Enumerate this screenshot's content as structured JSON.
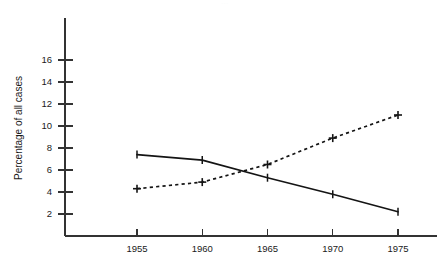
{
  "figure": {
    "background_color": "#ffffff",
    "ink_color": "#141414",
    "cropped_title_remnant": "..."
  },
  "chart_data": {
    "type": "line",
    "title": "",
    "xlabel": "",
    "ylabel": "Percentage of all cases",
    "x": [
      1955,
      1960,
      1965,
      1970,
      1975
    ],
    "xtick_labels": [
      "1955",
      "1960",
      "1965",
      "1970",
      "1975"
    ],
    "ytick_labels": [
      "2",
      "4",
      "6",
      "8",
      "10",
      "12",
      "14",
      "16"
    ],
    "yticks": [
      2,
      4,
      6,
      8,
      10,
      12,
      14,
      16
    ],
    "xlim": [
      1951.5,
      1978.5
    ],
    "ylim": [
      0,
      18.6
    ],
    "grid": false,
    "legend": "none",
    "series": [
      {
        "name": "declining-series",
        "style": "solid",
        "marker": "vertical-tick",
        "values": [
          7.4,
          6.9,
          5.3,
          3.8,
          2.2
        ]
      },
      {
        "name": "rising-series",
        "style": "dashed",
        "marker": "plus",
        "values": [
          4.3,
          4.9,
          6.5,
          8.9,
          11.0
        ]
      }
    ]
  }
}
